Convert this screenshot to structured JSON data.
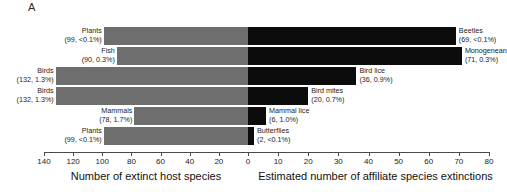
{
  "panel": {
    "letter": "A"
  },
  "chart_data": {
    "type": "bar",
    "orientation": "horizontal-diverging",
    "title": "",
    "grid": false,
    "legend": null,
    "left_axis": {
      "label": "Number of extinct host species",
      "ticks": [
        140,
        120,
        100,
        80,
        60,
        40,
        20,
        0
      ],
      "range": [
        140,
        0
      ],
      "direction": "reversed",
      "bar_color": "#6e6e6e"
    },
    "right_axis": {
      "label": "Estimated number of affiliate species extinctions",
      "ticks": [
        0,
        10,
        20,
        30,
        40,
        50,
        60,
        70,
        80
      ],
      "range": [
        0,
        80
      ],
      "direction": "normal",
      "bar_color": "#0c0c0c"
    },
    "rows": [
      {
        "host": {
          "name": "Plants",
          "value": 99,
          "percent": "<0.1%",
          "stat": "(99, <0.1%)"
        },
        "affiliate": {
          "name": "Beetles",
          "value": 69,
          "percent": "<0.1%",
          "stat": "(69, <0.1%)"
        }
      },
      {
        "host": {
          "name": "Fish",
          "value": 90,
          "percent": "0.3%",
          "stat": "(90, 0.3%)"
        },
        "affiliate": {
          "name": "Monogenean",
          "value": 71,
          "percent": "0.3%",
          "stat": "(71, 0.3%)"
        }
      },
      {
        "host": {
          "name": "Birds",
          "value": 132,
          "percent": "1.3%",
          "stat": "(132, 1.3%)"
        },
        "affiliate": {
          "name": "Bird lice",
          "value": 36,
          "percent": "0.9%",
          "stat": "(36, 0.9%)"
        }
      },
      {
        "host": {
          "name": "Birds",
          "value": 132,
          "percent": "1.3%",
          "stat": "(132, 1.3%)"
        },
        "affiliate": {
          "name": "Bird mites",
          "value": 20,
          "percent": "0.7%",
          "stat": "(20, 0.7%)"
        }
      },
      {
        "host": {
          "name": "Mammals",
          "value": 78,
          "percent": "1.7%",
          "stat": "(78, 1.7%)"
        },
        "affiliate": {
          "name": "Mammal lice",
          "value": 6,
          "percent": "1.0%",
          "stat": "(6, 1.0%)"
        }
      },
      {
        "host": {
          "name": "Plants",
          "value": 99,
          "percent": "<0.1%",
          "stat": "(99, <0.1%)"
        },
        "affiliate": {
          "name": "Butterflies",
          "value": 2,
          "percent": "<0.1%",
          "stat": "(2, <0.1%)"
        }
      }
    ]
  }
}
